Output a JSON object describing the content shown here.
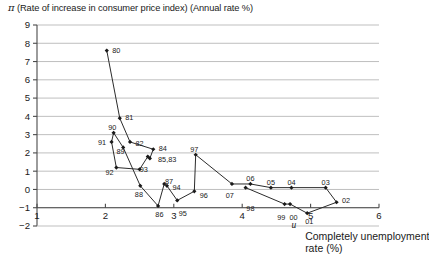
{
  "chart_data": {
    "type": "line",
    "title": "π (Rate of increase in consumer price index) (Annual rate %)",
    "title_symbol": "π",
    "title_rest": "(Rate of increase in consumer price index) (Annual rate %)",
    "xlabel": "Completely unemployment rate (%)",
    "xlabel_symbol": "u",
    "ylabel": "π (Rate of increase in consumer price index) (Annual rate %)",
    "xlim": [
      1,
      6
    ],
    "ylim": [
      -2,
      9
    ],
    "xticks": [
      1,
      2,
      3,
      4,
      5,
      6
    ],
    "xticklabels": [
      "1",
      "2",
      "3",
      "4",
      "5",
      "6"
    ],
    "yticks": [
      -2,
      -1,
      0,
      1,
      2,
      3,
      4,
      5,
      6,
      7,
      8,
      9
    ],
    "yticklabels": [
      "−2",
      "−1",
      "0",
      "1",
      "2",
      "3",
      "4",
      "5",
      "6",
      "7",
      "8",
      "9"
    ],
    "grid": "horizontal",
    "legend": "none",
    "series": [
      {
        "name": "Phillips curve (Japan, 1980-2007)",
        "marker": "diamond",
        "points": [
          {
            "label": "80",
            "x": 2.02,
            "y": 7.6,
            "lx": 2.1,
            "ly": 7.62,
            "anchor": "start"
          },
          {
            "label": "81",
            "x": 2.21,
            "y": 3.9,
            "lx": 2.29,
            "ly": 3.92,
            "anchor": "start"
          },
          {
            "label": "82",
            "x": 2.36,
            "y": 2.6,
            "lx": 2.44,
            "ly": 2.52,
            "anchor": "start"
          },
          {
            "label": "83",
            "x": 2.65,
            "y": 1.7,
            "lx": 2.77,
            "ly": 1.62,
            "anchor": "start"
          },
          {
            "label": "84",
            "x": 2.7,
            "y": 2.2,
            "lx": 2.78,
            "ly": 2.22,
            "anchor": "start"
          },
          {
            "label": "85",
            "x": 2.62,
            "y": 1.8,
            "lx": 2.62,
            "ly": 1.62,
            "anchor": "start"
          },
          {
            "label": "86",
            "x": 2.77,
            "y": -0.9,
            "lx": 2.79,
            "ly": -1.35,
            "anchor": "middle"
          },
          {
            "label": "87",
            "x": 2.86,
            "y": 0.3,
            "lx": 2.87,
            "ly": 0.46,
            "anchor": "start"
          },
          {
            "label": "88",
            "x": 2.51,
            "y": 0.2,
            "lx": 2.49,
            "ly": -0.28,
            "anchor": "middle"
          },
          {
            "label": "89",
            "x": 2.26,
            "y": 2.3,
            "lx": 2.22,
            "ly": 2.06,
            "anchor": "middle"
          },
          {
            "label": "90",
            "x": 2.12,
            "y": 3.1,
            "lx": 2.1,
            "ly": 3.38,
            "anchor": "middle"
          },
          {
            "label": "91",
            "x": 2.09,
            "y": 2.6,
            "lx": 1.95,
            "ly": 2.58,
            "anchor": "middle"
          },
          {
            "label": "92",
            "x": 2.16,
            "y": 1.2,
            "lx": 2.06,
            "ly": 0.92,
            "anchor": "middle"
          },
          {
            "label": "93",
            "x": 2.5,
            "y": 1.1,
            "lx": 2.56,
            "ly": 1.12,
            "anchor": "middle"
          },
          {
            "label": "94",
            "x": 2.9,
            "y": 0.2,
            "lx": 2.98,
            "ly": 0.12,
            "anchor": "start"
          },
          {
            "label": "95",
            "x": 3.05,
            "y": -0.6,
            "lx": 3.13,
            "ly": -1.3,
            "anchor": "middle"
          },
          {
            "label": "96",
            "x": 3.3,
            "y": -0.1,
            "lx": 3.38,
            "ly": -0.3,
            "anchor": "start"
          },
          {
            "label": "97",
            "x": 3.32,
            "y": 1.9,
            "lx": 3.3,
            "ly": 2.18,
            "anchor": "middle"
          },
          {
            "label": "98",
            "x": 4.05,
            "y": 0.1,
            "lx": 4.12,
            "ly": -1.04,
            "anchor": "middle"
          },
          {
            "label": "99",
            "x": 4.62,
            "y": -0.8,
            "lx": 4.57,
            "ly": -1.52,
            "anchor": "middle"
          },
          {
            "label": "00",
            "x": 4.7,
            "y": -0.8,
            "lx": 4.75,
            "ly": -1.52,
            "anchor": "middle"
          },
          {
            "label": "01",
            "x": 4.95,
            "y": -1.3,
            "lx": 4.98,
            "ly": -1.76,
            "anchor": "middle"
          },
          {
            "label": "02",
            "x": 5.38,
            "y": -0.7,
            "lx": 5.46,
            "ly": -0.62,
            "anchor": "start"
          },
          {
            "label": "03",
            "x": 5.22,
            "y": 0.1,
            "lx": 5.22,
            "ly": 0.38,
            "anchor": "middle"
          },
          {
            "label": "04",
            "x": 4.72,
            "y": 0.1,
            "lx": 4.72,
            "ly": 0.38,
            "anchor": "middle"
          },
          {
            "label": "05",
            "x": 4.42,
            "y": 0.1,
            "lx": 4.42,
            "ly": 0.4,
            "anchor": "middle"
          },
          {
            "label": "06",
            "x": 4.12,
            "y": 0.3,
            "lx": 4.12,
            "ly": 0.6,
            "anchor": "middle"
          },
          {
            "label": "07",
            "x": 3.85,
            "y": 0.3,
            "lx": 3.82,
            "ly": -0.3,
            "anchor": "middle"
          }
        ],
        "path_order": [
          "80",
          "81",
          "82",
          "84",
          "83",
          "85",
          "93",
          "92",
          "91",
          "90",
          "89",
          "88",
          "86",
          "87",
          "94",
          "95",
          "96",
          "97",
          "07",
          "06",
          "05",
          "04",
          "03",
          "02",
          "01",
          "00",
          "99",
          "98"
        ],
        "combined_labels": [
          {
            "text": "85,83",
            "x": 2.77,
            "y": 1.62
          }
        ]
      }
    ],
    "colors": {
      "line": "#2b2b2b",
      "marker": "#1a1a1a",
      "grid": "#b8b8b8",
      "axis": "#4a4a4a",
      "text": "#1a1a1a",
      "background": "#ffffff"
    }
  }
}
